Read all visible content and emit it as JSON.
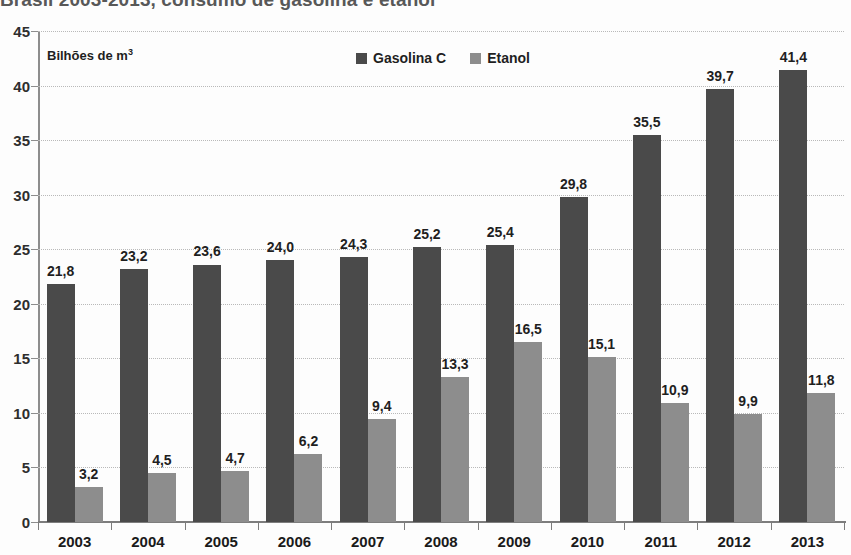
{
  "chart_data": {
    "type": "bar",
    "title": "Brasil 2003-2013, consumo de gasolina e etanol",
    "axis_unit": "Bilhões de  m",
    "axis_unit_sup": "3",
    "xlabel": "",
    "ylabel": "Bilhões de m³",
    "ylim": [
      0,
      45
    ],
    "ytick_step": 5,
    "yticks": [
      "0",
      "5",
      "10",
      "15",
      "20",
      "25",
      "30",
      "35",
      "40",
      "45"
    ],
    "grid": true,
    "grid_style": "dotted-horizontal",
    "legend_position": "top-center",
    "categories": [
      "2003",
      "2004",
      "2005",
      "2006",
      "2007",
      "2008",
      "2009",
      "2010",
      "2011",
      "2012",
      "2013"
    ],
    "series": [
      {
        "name": "Gasolina C",
        "color": "#4a4a4a",
        "values": [
          21.8,
          23.2,
          23.6,
          24.0,
          24.3,
          25.2,
          25.4,
          29.8,
          35.5,
          39.7,
          41.4
        ],
        "labels": [
          "21,8",
          "23,2",
          "23,6",
          "24,0",
          "24,3",
          "25,2",
          "25,4",
          "29,8",
          "35,5",
          "39,7",
          "41,4"
        ]
      },
      {
        "name": "Etanol",
        "color": "#8d8d8d",
        "values": [
          3.2,
          4.5,
          4.7,
          6.2,
          9.4,
          13.3,
          16.5,
          15.1,
          10.9,
          9.9,
          11.8
        ],
        "labels": [
          "3,2",
          "4,5",
          "4,7",
          "6,2",
          "9,4",
          "13,3",
          "16,5",
          "15,1",
          "10,9",
          "9,9",
          "11,8"
        ]
      }
    ]
  }
}
